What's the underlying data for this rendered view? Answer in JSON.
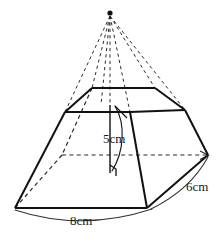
{
  "figure": {
    "shape": "frustum",
    "background_color": "#ffffff",
    "stroke_color": "#1a1a1a",
    "hidden_stroke_color": "#2b2b2b",
    "labels": {
      "height": "5cm",
      "slant_side": "6cm",
      "base_edge": "8cm"
    },
    "apex": {
      "name": "apex-point",
      "x": 110,
      "y": 14
    },
    "measurements": [
      {
        "name": "height",
        "value": 5,
        "unit": "cm",
        "text": "5cm",
        "target": "vertical-height-line"
      },
      {
        "name": "slant-side",
        "value": 6,
        "unit": "cm",
        "text": "6cm",
        "target": "right-slant-edge"
      },
      {
        "name": "base-edge",
        "value": 8,
        "unit": "cm",
        "text": "8cm",
        "target": "front-base-edge"
      }
    ],
    "geometry": {
      "top_face": [
        [
          92,
          88
        ],
        [
          155,
          88
        ],
        [
          185,
          110
        ],
        [
          130,
          112
        ],
        [
          65,
          112
        ],
        [
          72,
          98
        ]
      ],
      "base_face": [
        [
          15,
          208
        ],
        [
          147,
          208
        ],
        [
          208,
          155
        ],
        [
          160,
          132
        ],
        [
          62,
          155
        ]
      ],
      "solid_edges": [
        {
          "name": "top-back-edge",
          "from": [
            92,
            88
          ],
          "to": [
            155,
            88
          ]
        },
        {
          "name": "top-right-edge",
          "from": [
            155,
            88
          ],
          "to": [
            185,
            110
          ]
        },
        {
          "name": "top-front-right-edge",
          "from": [
            185,
            110
          ],
          "to": [
            130,
            112
          ]
        },
        {
          "name": "top-front-edge",
          "from": [
            130,
            112
          ],
          "to": [
            65,
            112
          ]
        },
        {
          "name": "top-left-edge",
          "from": [
            65,
            112
          ],
          "to": [
            92,
            88
          ]
        },
        {
          "name": "left-slant-edge",
          "from": [
            65,
            112
          ],
          "to": [
            15,
            208
          ]
        },
        {
          "name": "front-base-edge",
          "from": [
            15,
            208
          ],
          "to": [
            147,
            208
          ]
        },
        {
          "name": "mid-front-slant-edge",
          "from": [
            130,
            112
          ],
          "to": [
            147,
            208
          ]
        },
        {
          "name": "right-slant-edge",
          "from": [
            185,
            110
          ],
          "to": [
            208,
            155
          ]
        },
        {
          "name": "lower-right-edge",
          "from": [
            208,
            155
          ],
          "to": [
            147,
            208
          ]
        }
      ],
      "hidden_edges": [
        {
          "name": "apex-to-top-back-left",
          "from": [
            110,
            14
          ],
          "to": [
            92,
            88
          ]
        },
        {
          "name": "apex-to-top-back-right",
          "from": [
            110,
            14
          ],
          "to": [
            155,
            88
          ]
        },
        {
          "name": "apex-to-top-left",
          "from": [
            110,
            14
          ],
          "to": [
            65,
            112
          ]
        },
        {
          "name": "apex-to-top-right",
          "from": [
            110,
            14
          ],
          "to": [
            185,
            110
          ]
        },
        {
          "name": "apex-to-top-front",
          "from": [
            110,
            14
          ],
          "to": [
            130,
            112
          ]
        },
        {
          "name": "apex-to-center",
          "from": [
            110,
            14
          ],
          "to": [
            110,
            105
          ]
        },
        {
          "name": "hidden-back-left-slant",
          "from": [
            92,
            88
          ],
          "to": [
            62,
            155
          ]
        },
        {
          "name": "hidden-back-diagonal",
          "from": [
            62,
            155
          ],
          "to": [
            15,
            208
          ]
        },
        {
          "name": "hidden-base-horizontal",
          "from": [
            62,
            155
          ],
          "to": [
            208,
            155
          ]
        }
      ],
      "height_line": {
        "name": "vertical-height-line",
        "from": [
          110,
          105
        ],
        "to": [
          110,
          172
        ]
      },
      "right_angle_marker": {
        "name": "right-angle-marker",
        "x": 110,
        "y": 172,
        "size": 8
      }
    },
    "arcs": [
      {
        "name": "base-measure-arc",
        "from": [
          15,
          209
        ],
        "to": [
          150,
          209
        ],
        "sag": 14
      },
      {
        "name": "slant-measure-arc",
        "from": [
          208,
          156
        ],
        "to": [
          150,
          209
        ],
        "sag": 10
      },
      {
        "name": "height-leader-arc",
        "from": [
          113,
          107
        ],
        "to": [
          110,
          170
        ],
        "sag": 9
      }
    ]
  }
}
